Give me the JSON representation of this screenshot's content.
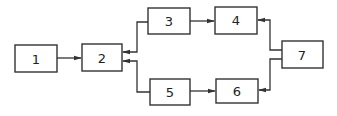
{
  "diagram": {
    "type": "block-diagram",
    "blocks": [
      {
        "id": "1",
        "label": "1"
      },
      {
        "id": "2",
        "label": "2"
      },
      {
        "id": "3",
        "label": "3"
      },
      {
        "id": "4",
        "label": "4"
      },
      {
        "id": "5",
        "label": "5"
      },
      {
        "id": "6",
        "label": "6"
      },
      {
        "id": "7",
        "label": "7"
      }
    ],
    "connections": [
      {
        "from": "1",
        "to": "2"
      },
      {
        "from": "3",
        "to": "2"
      },
      {
        "from": "5",
        "to": "2"
      },
      {
        "from": "3",
        "to": "4"
      },
      {
        "from": "5",
        "to": "6"
      },
      {
        "from": "7",
        "to": "4"
      },
      {
        "from": "7",
        "to": "6"
      }
    ],
    "colors": {
      "stroke": "#333333",
      "background": "#ffffff"
    }
  }
}
